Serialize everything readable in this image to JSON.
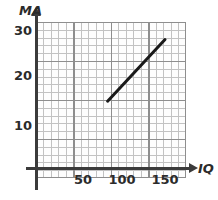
{
  "chart_data": {
    "type": "line",
    "title": "",
    "xlabel": "IQ",
    "ylabel": "MA",
    "xlim": [
      0,
      160
    ],
    "ylim": [
      0,
      32
    ],
    "grid": true,
    "grid_style": "graph-paper",
    "legend": "none",
    "xticks": [
      50,
      100,
      150
    ],
    "xtick_labels": [
      "50",
      "100",
      "150"
    ],
    "yticks": [
      10,
      20,
      30
    ],
    "ytick_labels": [
      "10",
      "20",
      "30"
    ],
    "series": [
      {
        "name": "MA vs IQ",
        "x": [
          80,
          150
        ],
        "y": [
          15,
          28
        ],
        "color": "#1a1a1a",
        "line_width": 3,
        "style": "solid"
      }
    ],
    "annotations": []
  },
  "axes": {
    "y_title": "MA",
    "x_title": "IQ",
    "y_arrow": "arrow-up-icon",
    "x_arrow": "arrow-right-icon"
  },
  "ticks": {
    "y": [
      {
        "label": "30",
        "value": 30
      },
      {
        "label": "20",
        "value": 20
      },
      {
        "label": "10",
        "value": 10
      }
    ],
    "x": [
      {
        "label": "50",
        "value": 50
      },
      {
        "label": "100",
        "value": 100
      },
      {
        "label": "150",
        "value": 150
      }
    ]
  }
}
